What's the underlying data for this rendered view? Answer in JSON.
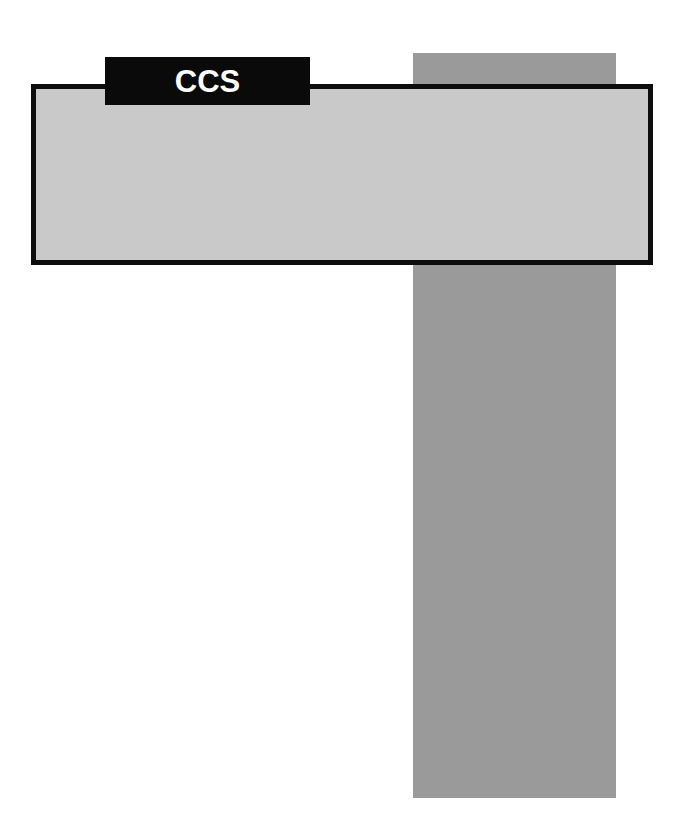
{
  "diagram": {
    "title": "CCS",
    "background_color": "#ffffff",
    "label": {
      "text": "CCS",
      "text_color": "#ffffff",
      "background_color": "#0a0a0a"
    },
    "shapes": {
      "vertical_bar": {
        "name": "vertical-column",
        "fill_color": "#9a9a9a",
        "orientation": "vertical"
      },
      "horizontal_bar": {
        "name": "horizontal-band",
        "fill_color": "#c9c9c9",
        "border_color": "#0d0d0d",
        "orientation": "horizontal"
      }
    }
  }
}
